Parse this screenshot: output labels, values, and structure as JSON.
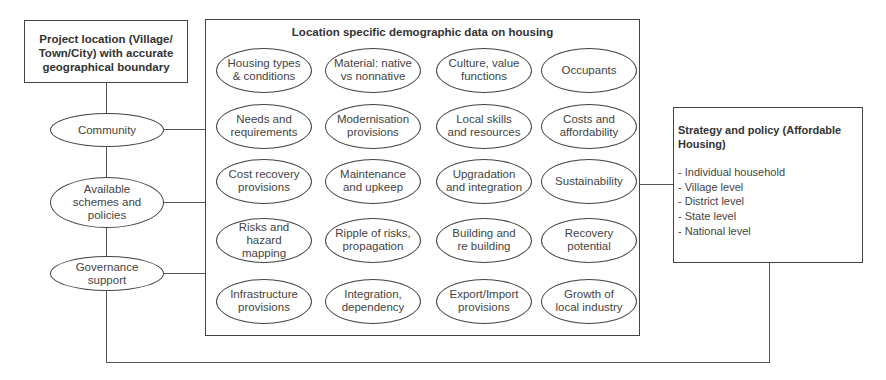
{
  "project_box": {
    "label": "Project location (Village/\nTown/City) with accurate\ngeographical boundary"
  },
  "left_nodes": [
    {
      "label": "Community"
    },
    {
      "label": "Available\nschemes and\npolicies"
    },
    {
      "label": "Governance\nsupport"
    }
  ],
  "central_box": {
    "title": "Location specific demographic data on housing",
    "rows": [
      [
        "Housing types\n& conditions",
        "Material: native\nvs nonnative",
        "Culture, value\nfunctions",
        "Occupants"
      ],
      [
        "Needs and\nrequirements",
        "Modernisation\nprovisions",
        "Local skills\nand resources",
        "Costs and\naffordability"
      ],
      [
        "Cost recovery\nprovisions",
        "Maintenance\nand upkeep",
        "Upgradation\nand integration",
        "Sustainability"
      ],
      [
        "Risks and\nhazard\nmapping",
        "Ripple of risks,\npropagation",
        "Building and\nre building",
        "Recovery\npotential"
      ],
      [
        "Infrastructure\nprovisions",
        "Integration,\ndependency",
        "Export/Import\nprovisions",
        "Growth of\nlocal industry"
      ]
    ]
  },
  "strategy_box": {
    "title": "Strategy and policy (Affordable\nHousing)",
    "items": [
      "- Individual household",
      "- Village level",
      "- District level",
      "- State level",
      "- National level"
    ]
  }
}
